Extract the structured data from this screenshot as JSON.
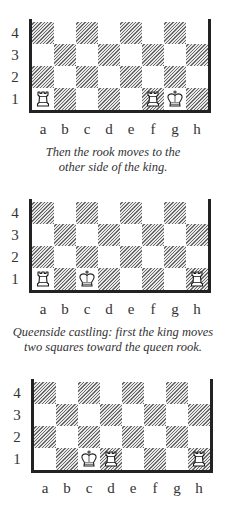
{
  "files": [
    "a",
    "b",
    "c",
    "d",
    "e",
    "f",
    "g",
    "h"
  ],
  "ranks": [
    "4",
    "3",
    "2",
    "1"
  ],
  "colors": {
    "frame": "#222222",
    "hatch": "#6a6a6a",
    "light_square": "#ffffff"
  },
  "diagrams": [
    {
      "id": "kingside-step2",
      "pieces": [
        {
          "type": "rook",
          "square": "a1",
          "color": "white"
        },
        {
          "type": "rook",
          "square": "f1",
          "color": "white"
        },
        {
          "type": "king",
          "square": "g1",
          "color": "white"
        }
      ],
      "caption": [
        "Then the rook moves to the",
        "other side of the king."
      ]
    },
    {
      "id": "queenside-step1",
      "pieces": [
        {
          "type": "rook",
          "square": "a1",
          "color": "white"
        },
        {
          "type": "king",
          "square": "c1",
          "color": "white"
        },
        {
          "type": "rook",
          "square": "h1",
          "color": "white"
        }
      ],
      "caption": [
        "Queenside castling: first the king moves",
        "two squares toward the queen rook."
      ]
    },
    {
      "id": "queenside-step2",
      "pieces": [
        {
          "type": "king",
          "square": "c1",
          "color": "white"
        },
        {
          "type": "rook",
          "square": "d1",
          "color": "white"
        },
        {
          "type": "rook",
          "square": "h1",
          "color": "white"
        }
      ],
      "caption": []
    }
  ]
}
